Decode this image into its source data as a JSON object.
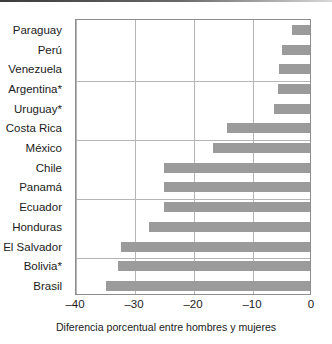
{
  "chart_data": {
    "type": "bar",
    "orientation": "horizontal",
    "title": "",
    "subtitle": "",
    "xlabel": "Diferencia porcentual entre hombres y mujeres",
    "ylabel": "",
    "xlim": [
      -40,
      0
    ],
    "ylim": null,
    "grid": "vertical-major-and-horizontal-every-3-rows",
    "legend": null,
    "bar_color": "#9b9b9b",
    "axis_color": "#8d8d8d",
    "grid_color": "#b5b5b5",
    "xticks": [
      -40,
      -30,
      -20,
      -10,
      0
    ],
    "xtick_labels": [
      "–40",
      "–30",
      "–20",
      "–10",
      "0"
    ],
    "categories": [
      "Paraguay",
      "Perú",
      "Venezuela",
      "Argentina*",
      "Uruguay*",
      "Costa Rica",
      "México",
      "Chile",
      "Panamá",
      "Ecuador",
      "Honduras",
      "El Salvador",
      "Bolivia*",
      "Brasil"
    ],
    "values": [
      -3.0,
      -4.7,
      -5.2,
      -5.4,
      -6.1,
      -14.1,
      -16.5,
      -24.7,
      -24.7,
      -24.7,
      -27.3,
      -32.1,
      -32.5,
      -34.5
    ],
    "annotations": [
      "* Países marcados con asterisco"
    ]
  },
  "axis": {
    "caption": "Diferencia porcentual entre hombres y mujeres"
  }
}
